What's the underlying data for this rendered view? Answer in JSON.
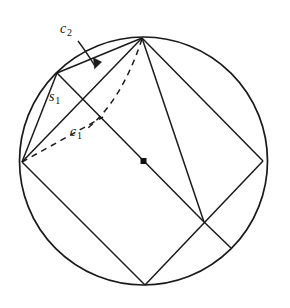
{
  "figure": {
    "background_color": "#ffffff",
    "stroke_color": "#1a1a1a",
    "labels": [
      {
        "id": "c2",
        "base": "c",
        "subscript": "2",
        "x": 60,
        "y": 22
      },
      {
        "id": "s1",
        "base": "s",
        "subscript": "1",
        "x": 49,
        "y": 90
      },
      {
        "id": "c1",
        "base": "c",
        "subscript": "1",
        "x": 70,
        "y": 125
      }
    ],
    "center_point": {
      "x": 143.5,
      "y": 161,
      "label": "center-dot"
    },
    "circle": {
      "cx": 143.5,
      "cy": 161,
      "r": 124
    },
    "vertices": {
      "top": {
        "x": 142,
        "y": 38
      },
      "right": {
        "x": 263,
        "y": 161
      },
      "bottom": {
        "x": 145,
        "y": 285
      },
      "left": {
        "x": 22,
        "y": 162
      },
      "upper_left": {
        "x": 57,
        "y": 73
      },
      "lower_right": {
        "x": 231,
        "y": 248
      }
    },
    "solid_segments": [
      {
        "name": "square-side-top-left",
        "x1": 142,
        "y1": 38,
        "x2": 22,
        "y2": 162
      },
      {
        "name": "square-side-left-bottom",
        "x1": 22,
        "y1": 162,
        "x2": 145,
        "y2": 285
      },
      {
        "name": "square-side-bottom-right",
        "x1": 145,
        "y1": 285,
        "x2": 263,
        "y2": 161
      },
      {
        "name": "square-side-right-top",
        "x1": 263,
        "y1": 161,
        "x2": 142,
        "y2": 38
      },
      {
        "name": "diagonal-top-bottom",
        "x1": 142,
        "y1": 38,
        "x2": 204,
        "y2": 222
      },
      {
        "name": "chord-c2-upperleft-top",
        "x1": 57,
        "y1": 73,
        "x2": 142,
        "y2": 38
      },
      {
        "name": "chord-s1-left-upperleft",
        "x1": 22,
        "y1": 162,
        "x2": 57,
        "y2": 73
      },
      {
        "name": "chord-upperleft-cross",
        "x1": 57,
        "y1": 73,
        "x2": 204,
        "y2": 222
      },
      {
        "name": "chord-cross-lowerright",
        "x1": 204,
        "y1": 222,
        "x2": 231,
        "y2": 248
      }
    ],
    "dashed_paths": [
      {
        "name": "dashed-arc-top-to-left",
        "d": "M 142 39 C 129 78 112 108 88 128"
      },
      {
        "name": "dashed-chord-left-c1",
        "d": "M 22 162 L 103 117"
      }
    ],
    "arrow": {
      "name": "c2-leader-arrow",
      "d": "M 78 41 C 85 50 90 58 95 66",
      "tip": {
        "x": 96,
        "y": 68
      }
    }
  }
}
